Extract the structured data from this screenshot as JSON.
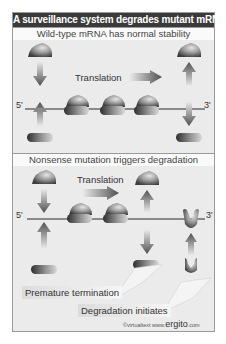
{
  "figure": {
    "title": "A surveillance system degrades mutant mRNA",
    "top_panel": {
      "header": "Wild-type mRNA has normal stability",
      "translation_label": "Translation",
      "five_prime": "5'",
      "three_prime": "3'",
      "ribosome_count": 3
    },
    "bottom_panel": {
      "header": "Nonsense mutation triggers degradation",
      "translation_label": "Translation",
      "five_prime": "5'",
      "three_prime": "3'",
      "ribosome_count": 2,
      "callout_premature": "Premature termination",
      "callout_degradation": "Degradation initiates"
    },
    "credit": {
      "prefix": "©virtualtext  www.",
      "brand": "ergito",
      "suffix": ".com"
    },
    "colors": {
      "title_bg": "#3a3a3a",
      "panel_bg": "#ebebeb",
      "ribosome": "#808080",
      "mrna_line": "#8a8a8a"
    }
  }
}
